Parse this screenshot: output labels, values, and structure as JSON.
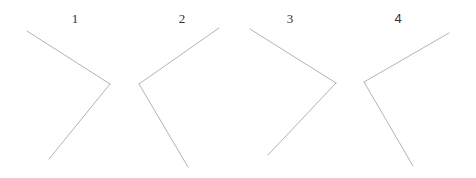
{
  "figures": [
    {
      "label": "1",
      "description": "angle opening to the left (vertex on the right)"
    },
    {
      "label": "2",
      "description": "angle opening to the right (vertex on the left)"
    },
    {
      "label": "3",
      "description": "angle opening to the left (vertex on the right)"
    },
    {
      "label": "4",
      "description": "angle opening to the right (vertex on the left)"
    }
  ],
  "colors": {
    "line": "#b4b4b4",
    "label": "#333333",
    "background": "#ffffff"
  }
}
